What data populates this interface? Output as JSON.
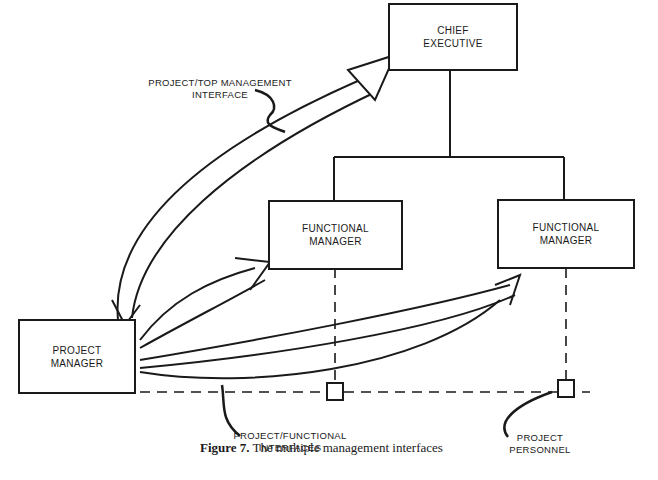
{
  "diagram": {
    "nodes": {
      "chief_executive": {
        "line1": "CHIEF",
        "line2": "EXECUTIVE"
      },
      "functional_manager_1": {
        "line1": "FUNCTIONAL",
        "line2": "MANAGER"
      },
      "functional_manager_2": {
        "line1": "FUNCTIONAL",
        "line2": "MANAGER"
      },
      "project_manager": {
        "line1": "PROJECT",
        "line2": "MANAGER"
      }
    },
    "annotations": {
      "top_interface": {
        "line1": "PROJECT/TOP MANAGEMENT",
        "line2": "INTERFACE"
      },
      "functional_interfaces": {
        "line1": "PROJECT/FUNCTIONAL",
        "line2": "INTERFACES"
      },
      "project_personnel": {
        "line1": "PROJECT",
        "line2": "PERSONNEL"
      }
    },
    "caption": {
      "figure": "Figure 7.",
      "text": " The multiple management interfaces"
    }
  }
}
